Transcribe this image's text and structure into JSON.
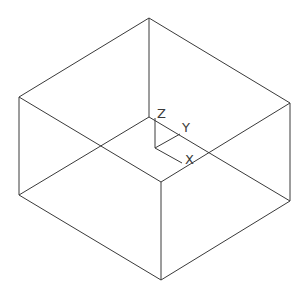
{
  "diagram": {
    "type": "isometric-wireframe-box",
    "stroke_color": "#3a3a3a",
    "background": "#ffffff",
    "vertices": {
      "top_back": [
        149,
        18
      ],
      "top_left": [
        19,
        97
      ],
      "top_right": [
        290,
        103
      ],
      "top_front": [
        161,
        182
      ],
      "bottom_back": [
        149,
        117
      ],
      "bottom_left": [
        19,
        195
      ],
      "bottom_right": [
        290,
        201
      ],
      "bottom_front": [
        161,
        280
      ]
    },
    "edges": [
      [
        "top_back",
        "top_left"
      ],
      [
        "top_back",
        "top_right"
      ],
      [
        "top_left",
        "top_front"
      ],
      [
        "top_right",
        "top_front"
      ],
      [
        "top_back",
        "bottom_back"
      ],
      [
        "top_left",
        "bottom_left"
      ],
      [
        "top_right",
        "bottom_right"
      ],
      [
        "top_front",
        "bottom_front"
      ],
      [
        "bottom_back",
        "bottom_left"
      ],
      [
        "bottom_back",
        "bottom_right"
      ],
      [
        "bottom_left",
        "bottom_front"
      ],
      [
        "bottom_right",
        "bottom_front"
      ]
    ],
    "axis_indicator": {
      "origin": [
        155,
        148
      ],
      "z_end": [
        155,
        118
      ],
      "y_end": [
        180,
        134
      ],
      "x_end": [
        182,
        163
      ],
      "labels": {
        "z": "Z",
        "y": "Y",
        "x": "X"
      },
      "label_positions": {
        "z": [
          157,
          118
        ],
        "y": [
          182,
          132
        ],
        "x": [
          185,
          164
        ]
      }
    }
  }
}
